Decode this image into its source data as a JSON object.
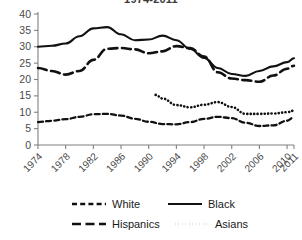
{
  "chart_data": {
    "type": "line",
    "title": "1974-2011",
    "xlabel": "",
    "ylabel": "",
    "ylim": [
      0,
      40
    ],
    "yticks": [
      0,
      5,
      10,
      15,
      20,
      25,
      30,
      35,
      40
    ],
    "grid": false,
    "legend_position": "bottom",
    "categories": [
      "1974",
      "1978",
      "1982",
      "1986",
      "1990",
      "1994",
      "1998",
      "2002",
      "2006",
      "2010",
      "2011"
    ],
    "x": [
      1974,
      1978,
      1982,
      1986,
      1990,
      1994,
      1998,
      2002,
      2006,
      2010,
      2011
    ],
    "series": [
      {
        "name": "White",
        "style": "short-dashed",
        "color": "#111111",
        "x": [
          1974,
          1976,
          1978,
          1980,
          1982,
          1984,
          1986,
          1988,
          1990,
          1992,
          1994,
          1996,
          1998,
          2000,
          2002,
          2004,
          2006,
          2008,
          2010,
          2011
        ],
        "values": [
          7.0,
          7.4,
          7.9,
          8.6,
          9.4,
          9.5,
          9.0,
          8.0,
          7.1,
          6.4,
          6.3,
          7.0,
          8.0,
          8.6,
          8.2,
          6.8,
          5.8,
          6.0,
          7.4,
          8.5
        ]
      },
      {
        "name": "Black",
        "style": "solid",
        "color": "#111111",
        "x": [
          1974,
          1976,
          1978,
          1980,
          1982,
          1984,
          1986,
          1988,
          1990,
          1992,
          1994,
          1996,
          1998,
          2000,
          2002,
          2004,
          2006,
          2008,
          2010,
          2011
        ],
        "values": [
          30.0,
          30.3,
          31.0,
          33.2,
          35.6,
          36.0,
          33.8,
          32.0,
          32.2,
          33.4,
          32.0,
          29.3,
          26.6,
          23.5,
          21.7,
          21.1,
          22.6,
          24.0,
          25.3,
          26.5
        ]
      },
      {
        "name": "Hispanics",
        "style": "long-dashed",
        "color": "#111111",
        "x": [
          1974,
          1976,
          1978,
          1980,
          1982,
          1984,
          1986,
          1988,
          1990,
          1992,
          1994,
          1996,
          1998,
          2000,
          2002,
          2004,
          2006,
          2008,
          2010,
          2011
        ],
        "values": [
          23.5,
          22.6,
          21.5,
          22.6,
          26.0,
          29.4,
          29.6,
          29.2,
          28.0,
          28.6,
          30.2,
          29.6,
          27.0,
          22.2,
          20.3,
          19.8,
          19.3,
          21.2,
          23.3,
          24.2
        ]
      },
      {
        "name": "Asians",
        "style": "dotted",
        "color": "#111111",
        "x": [
          1991,
          1992,
          1994,
          1996,
          1998,
          2000,
          2002,
          2004,
          2006,
          2008,
          2010,
          2011
        ],
        "values": [
          15.3,
          14.2,
          12.2,
          11.5,
          12.3,
          13.1,
          11.6,
          9.5,
          9.5,
          9.6,
          10.0,
          10.5
        ]
      }
    ],
    "legend": [
      {
        "label": "White",
        "style": "short-dashed"
      },
      {
        "label": "Black",
        "style": "solid"
      },
      {
        "label": "Hispanics",
        "style": "long-dashed"
      },
      {
        "label": "Asians",
        "style": "dotted"
      }
    ]
  }
}
